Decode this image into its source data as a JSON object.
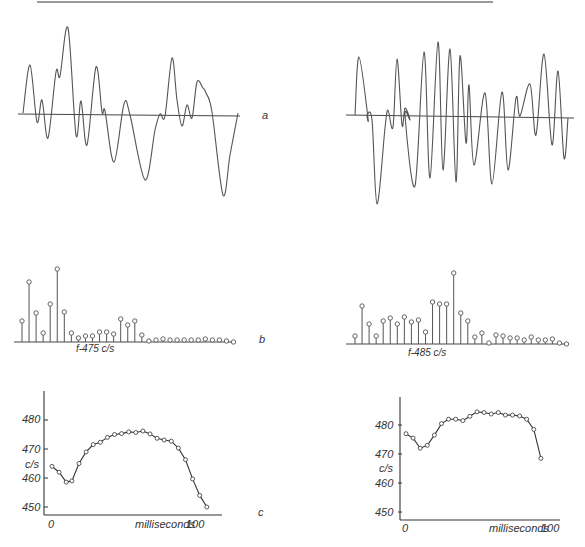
{
  "figure": {
    "panel_labels": {
      "a": "a",
      "b": "b",
      "c": "c"
    },
    "left_spectrum_label": "f-475 c/s",
    "right_spectrum_label": "f-485 c/s",
    "ylabel": "c/s",
    "xlabel": "milliseconds",
    "xtick_start": "0",
    "xtick_end": "100",
    "yticks": [
      "480",
      "470",
      "460",
      "450"
    ],
    "colors": {
      "ink": "#555555",
      "axis": "#333333",
      "rule": "#777777"
    }
  },
  "chart_data": [
    {
      "id": "a-left",
      "type": "line",
      "title": "waveform a (left)",
      "xlabel": "",
      "ylabel": "",
      "description": "Single-period waveform of a vowel sound; irregular oscillation about a horizontal baseline",
      "x": [
        0,
        2,
        4,
        6,
        8,
        10,
        12,
        14,
        16,
        18,
        20,
        22,
        24,
        26,
        28,
        30,
        32,
        34,
        36,
        38,
        40,
        42,
        44,
        46,
        48,
        50,
        52,
        54,
        56,
        58,
        60,
        62,
        64,
        66,
        68,
        70,
        72,
        74,
        76,
        78,
        80,
        82,
        84,
        86,
        88,
        90,
        92,
        94,
        96,
        98,
        100
      ],
      "values": [
        0,
        45,
        -7,
        10,
        -20,
        30,
        38,
        78,
        20,
        -17,
        10,
        -22,
        44,
        2,
        0,
        -25,
        -36,
        -10,
        8,
        -5,
        -28,
        -50,
        -16,
        2,
        48,
        -10,
        -12,
        2,
        -3,
        25,
        20,
        0,
        -65,
        -30,
        -20,
        0,
        0,
        0,
        0,
        0,
        0,
        0,
        0,
        0,
        0,
        0,
        0,
        0,
        0,
        0,
        0
      ]
    },
    {
      "id": "b-left",
      "type": "stem",
      "title": "spectrum b (left)",
      "xlabel": "f-475 c/s",
      "harmonics": [
        1,
        2,
        3,
        4,
        5,
        6,
        7,
        8,
        9,
        10,
        11,
        12,
        13,
        14,
        15,
        16,
        17,
        18,
        19,
        20,
        21,
        22,
        23,
        24,
        25,
        26,
        27,
        28,
        29,
        30,
        31
      ],
      "values": [
        21,
        60,
        29,
        9,
        38,
        73,
        30,
        9,
        4,
        6,
        6,
        10,
        10,
        8,
        23,
        17,
        21,
        7,
        1,
        2,
        3,
        2,
        2,
        2,
        2,
        2,
        3,
        2,
        2,
        1,
        0
      ]
    },
    {
      "id": "c-left",
      "type": "line",
      "title": "pitch contour c (left)",
      "xlabel": "milliseconds",
      "ylabel": "c/s",
      "ylim": [
        448,
        492
      ],
      "xlim": [
        -5,
        120
      ],
      "x": [
        0,
        5,
        10,
        14,
        19,
        24,
        29,
        34,
        39,
        44,
        49,
        54,
        59,
        64,
        69,
        74,
        79,
        84,
        89,
        94,
        99,
        104,
        109
      ],
      "values": [
        464,
        462,
        458.6,
        459,
        465,
        469,
        471.5,
        472.3,
        474,
        475,
        475.3,
        475.9,
        475.7,
        476.2,
        475.2,
        473.7,
        473.1,
        472.7,
        470.3,
        466.3,
        459.7,
        454,
        450
      ]
    },
    {
      "id": "a-right",
      "type": "line",
      "title": "waveform a (right)",
      "xlabel": "",
      "ylabel": "",
      "description": "Single-period waveform; more regular, larger oscillation about a horizontal baseline",
      "values": []
    },
    {
      "id": "b-right",
      "type": "stem",
      "title": "spectrum b (right)",
      "xlabel": "f-485 c/s",
      "harmonics": [
        1,
        2,
        3,
        4,
        5,
        6,
        7,
        8,
        9,
        10,
        11,
        12,
        13,
        14,
        15,
        16,
        17,
        18,
        19,
        20,
        21,
        22,
        23,
        24,
        25,
        26,
        27,
        28,
        29,
        30,
        31
      ],
      "values": [
        8,
        38,
        20,
        8,
        23,
        26,
        20,
        27,
        22,
        24,
        12,
        42,
        40,
        40,
        71,
        31,
        23,
        7,
        11,
        1,
        9,
        8,
        6,
        6,
        4,
        7,
        4,
        4,
        5,
        1,
        0
      ]
    },
    {
      "id": "c-right",
      "type": "line",
      "title": "pitch contour c (right)",
      "xlabel": "milliseconds",
      "ylabel": "c/s",
      "ylim": [
        448,
        492
      ],
      "xlim": [
        -5,
        115
      ],
      "x": [
        0,
        5,
        10,
        15,
        20,
        25,
        30,
        35,
        40,
        45,
        50,
        55,
        60,
        65,
        70,
        75,
        80,
        85,
        90,
        95
      ],
      "values": [
        477,
        475.5,
        472,
        473,
        476.5,
        480.5,
        482,
        482,
        481.5,
        483,
        484.5,
        484.3,
        483.8,
        484.3,
        483.4,
        483.4,
        483.1,
        482,
        478.5,
        468.5
      ]
    }
  ]
}
